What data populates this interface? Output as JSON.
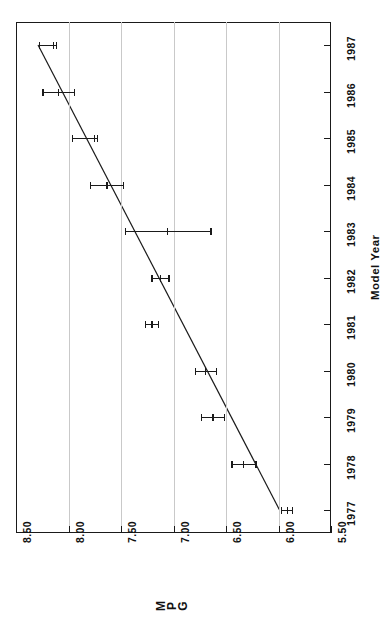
{
  "chart_data": {
    "type": "scatter",
    "title": "",
    "xlabel": "Model Year",
    "ylabel": "MPG",
    "orientation": "rotated-90-ccw",
    "grid": true,
    "legend": "none",
    "x": [
      1977,
      1978,
      1979,
      1980,
      1981,
      1982,
      1983,
      1984,
      1985,
      1986,
      1987
    ],
    "xlim": [
      1976.5,
      1987.5
    ],
    "xticks": [
      "1977",
      "1978",
      "1979",
      "1980",
      "1981",
      "1982",
      "1983",
      "1984",
      "1985",
      "1986",
      "1987"
    ],
    "ylim": [
      5.5,
      8.5
    ],
    "yticks": [
      "8.50",
      "8.00",
      "7.50",
      "7.00",
      "6.50",
      "6.00",
      "5.50"
    ],
    "ytick_values": [
      8.5,
      8.0,
      7.5,
      7.0,
      6.5,
      6.0,
      5.5
    ],
    "values": [
      5.92,
      6.34,
      6.63,
      6.7,
      7.21,
      7.13,
      7.06,
      7.64,
      7.76,
      8.1,
      8.15
    ],
    "err_low": [
      5.87,
      6.22,
      6.52,
      6.6,
      7.15,
      7.05,
      6.65,
      7.48,
      7.73,
      7.95,
      8.12
    ],
    "err_high": [
      5.98,
      6.45,
      6.74,
      6.8,
      7.27,
      7.21,
      7.46,
      7.8,
      7.97,
      8.25,
      8.28
    ],
    "fit_line": {
      "x_start": 1977,
      "y_start": 5.99,
      "x_end": 1987,
      "y_end": 8.29
    },
    "series": [
      {
        "name": "MPG with error bars",
        "values": [
          5.92,
          6.34,
          6.63,
          6.7,
          7.21,
          7.13,
          7.06,
          7.64,
          7.76,
          8.1,
          8.15
        ]
      }
    ]
  },
  "axes": {
    "value_axis_label": "MPG",
    "value_axis_label_chars": [
      "M",
      "P",
      "G"
    ],
    "category_axis_label": "Model Year"
  }
}
